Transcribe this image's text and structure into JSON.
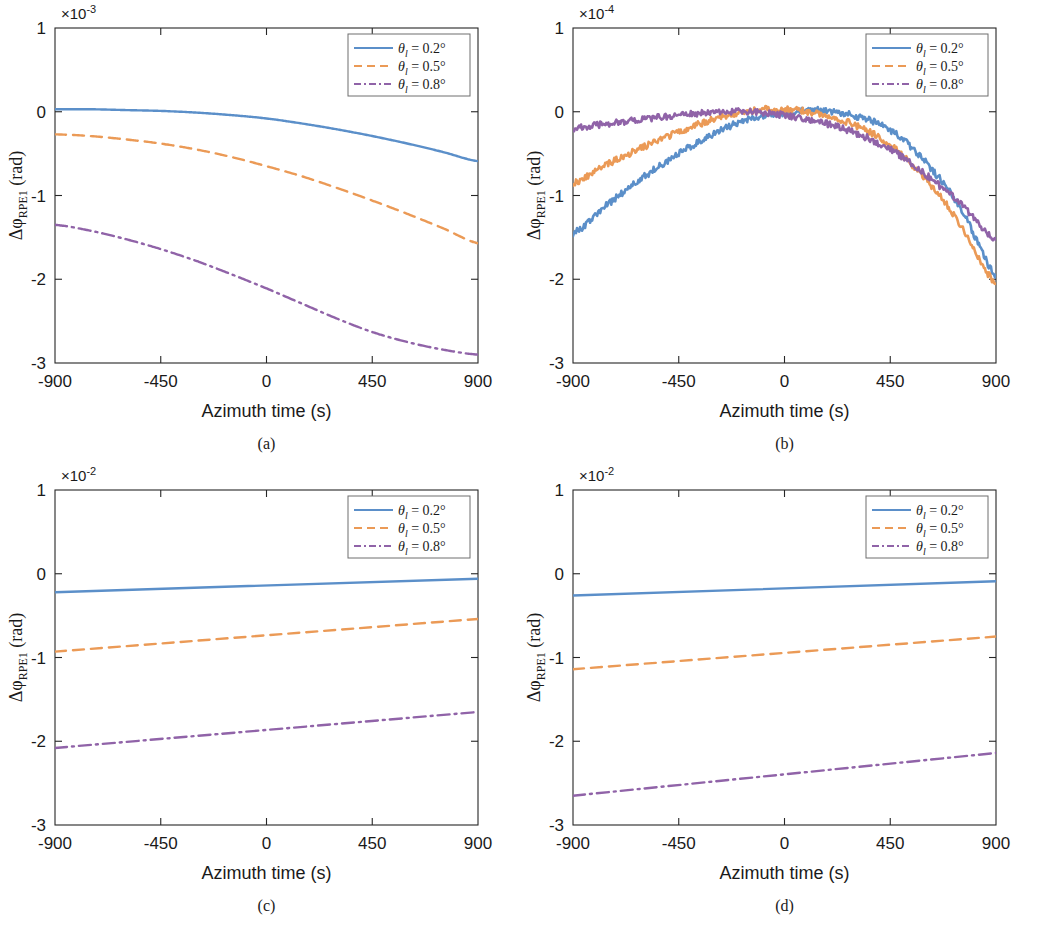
{
  "figure": {
    "panels": [
      {
        "id": "a",
        "caption": "(a)",
        "exponent_label": "×10",
        "exponent_power": "-3",
        "xlabel": "Azimuth time (s)",
        "ylabel_main": "Δφ",
        "ylabel_sub": "RPE1",
        "ylabel_unit": " (rad)",
        "xticks": [
          "-900",
          "-450",
          "0",
          "450",
          "900"
        ],
        "yticks": [
          "1",
          "0",
          "-1",
          "-2",
          "-3"
        ],
        "xlim": [
          -900,
          900
        ],
        "ylim": [
          -3,
          1
        ],
        "legend": [
          {
            "label": "θ",
            "sub": "l",
            "value": " = 0.2°",
            "style": "solid",
            "color": "#5B8FC9"
          },
          {
            "label": "θ",
            "sub": "l",
            "value": " = 0.5°",
            "style": "dashed",
            "color": "#EB9A56"
          },
          {
            "label": "θ",
            "sub": "l",
            "value": " = 0.8°",
            "style": "dashdot",
            "color": "#9063A8"
          }
        ]
      },
      {
        "id": "b",
        "caption": "(b)",
        "exponent_label": "×10",
        "exponent_power": "-4",
        "xlabel": "Azimuth time (s)",
        "ylabel_main": "Δφ",
        "ylabel_sub": "RPE1",
        "ylabel_unit": " (rad)",
        "xticks": [
          "-900",
          "-450",
          "0",
          "450",
          "900"
        ],
        "yticks": [
          "1",
          "0",
          "-1",
          "-2",
          "-3"
        ],
        "xlim": [
          -900,
          900
        ],
        "ylim": [
          -3,
          1
        ],
        "legend": [
          {
            "label": "θ",
            "sub": "l",
            "value": " = 0.2°",
            "style": "solid",
            "color": "#5B8FC9"
          },
          {
            "label": "θ",
            "sub": "l",
            "value": " = 0.5°",
            "style": "dashed",
            "color": "#EB9A56"
          },
          {
            "label": "θ",
            "sub": "l",
            "value": " = 0.8°",
            "style": "dashdot",
            "color": "#9063A8"
          }
        ]
      },
      {
        "id": "c",
        "caption": "(c)",
        "exponent_label": "×10",
        "exponent_power": "-2",
        "xlabel": "Azimuth time (s)",
        "ylabel_main": "Δφ",
        "ylabel_sub": "RPE1",
        "ylabel_unit": " (rad)",
        "xticks": [
          "-900",
          "-450",
          "0",
          "450",
          "900"
        ],
        "yticks": [
          "1",
          "0",
          "-1",
          "-2",
          "-3"
        ],
        "xlim": [
          -900,
          900
        ],
        "ylim": [
          -3,
          1
        ],
        "legend": [
          {
            "label": "θ",
            "sub": "l",
            "value": " = 0.2°",
            "style": "solid",
            "color": "#5B8FC9"
          },
          {
            "label": "θ",
            "sub": "l",
            "value": " = 0.5°",
            "style": "dashed",
            "color": "#EB9A56"
          },
          {
            "label": "θ",
            "sub": "l",
            "value": " = 0.8°",
            "style": "dashdot",
            "color": "#9063A8"
          }
        ]
      },
      {
        "id": "d",
        "caption": "(d)",
        "exponent_label": "×10",
        "exponent_power": "-2",
        "xlabel": "Azimuth time (s)",
        "ylabel_main": "Δφ",
        "ylabel_sub": "RPE1",
        "ylabel_unit": " (rad)",
        "xticks": [
          "-900",
          "-450",
          "0",
          "450",
          "900"
        ],
        "yticks": [
          "1",
          "0",
          "-1",
          "-2",
          "-3"
        ],
        "xlim": [
          -900,
          900
        ],
        "ylim": [
          -3,
          1
        ],
        "legend": [
          {
            "label": "θ",
            "sub": "l",
            "value": " = 0.2°",
            "style": "solid",
            "color": "#5B8FC9"
          },
          {
            "label": "θ",
            "sub": "l",
            "value": " = 0.5°",
            "style": "dashed",
            "color": "#EB9A56"
          },
          {
            "label": "θ",
            "sub": "l",
            "value": " = 0.8°",
            "style": "dashdot",
            "color": "#9063A8"
          }
        ]
      }
    ]
  },
  "chart_data": [
    {
      "panel": "a",
      "type": "line",
      "title": "",
      "xlabel": "Azimuth time (s)",
      "ylabel": "Δφ_RPE1 (rad)",
      "y_scale_exponent": -3,
      "xlim": [
        -900,
        900
      ],
      "ylim": [
        -3,
        1
      ],
      "grid": false,
      "legend_position": "top-right",
      "x": [
        -900,
        -750,
        -600,
        -450,
        -300,
        -150,
        0,
        150,
        300,
        450,
        600,
        750,
        900
      ],
      "series": [
        {
          "name": "θ_l = 0.2°",
          "style": "solid",
          "color": "#5B8FC9",
          "values": [
            0.03,
            0.03,
            0.02,
            0.01,
            -0.01,
            -0.04,
            -0.08,
            -0.14,
            -0.21,
            -0.29,
            -0.38,
            -0.48,
            -0.59
          ]
        },
        {
          "name": "θ_l = 0.5°",
          "style": "dashed",
          "color": "#EB9A56",
          "values": [
            -0.27,
            -0.29,
            -0.33,
            -0.38,
            -0.45,
            -0.54,
            -0.65,
            -0.77,
            -0.91,
            -1.06,
            -1.22,
            -1.39,
            -1.57
          ]
        },
        {
          "name": "θ_l = 0.8°",
          "style": "dashdot",
          "color": "#9063A8",
          "values": [
            -1.35,
            -1.42,
            -1.52,
            -1.64,
            -1.78,
            -1.94,
            -2.11,
            -2.29,
            -2.47,
            -2.63,
            -2.75,
            -2.84,
            -2.9
          ]
        }
      ]
    },
    {
      "panel": "b",
      "type": "line",
      "title": "",
      "xlabel": "Azimuth time (s)",
      "ylabel": "Δφ_RPE1 (rad)",
      "y_scale_exponent": -4,
      "xlim": [
        -900,
        900
      ],
      "ylim": [
        -3,
        1
      ],
      "grid": false,
      "noisy": true,
      "noise_amplitude": 0.04,
      "legend_position": "top-right",
      "x": [
        -900,
        -750,
        -600,
        -450,
        -300,
        -150,
        0,
        150,
        300,
        450,
        600,
        750,
        900
      ],
      "series": [
        {
          "name": "θ_l = 0.2°",
          "style": "solid",
          "color": "#5B8FC9",
          "values": [
            -1.45,
            -1.1,
            -0.78,
            -0.5,
            -0.26,
            -0.09,
            -0.02,
            0.02,
            -0.05,
            -0.22,
            -0.6,
            -1.15,
            -1.95
          ]
        },
        {
          "name": "θ_l = 0.5°",
          "style": "dashed",
          "color": "#EB9A56",
          "values": [
            -0.85,
            -0.62,
            -0.42,
            -0.24,
            -0.09,
            0.01,
            0.03,
            -0.03,
            -0.16,
            -0.4,
            -0.8,
            -1.35,
            -2.05
          ]
        },
        {
          "name": "θ_l = 0.8°",
          "style": "dashdot",
          "color": "#9063A8",
          "values": [
            -0.2,
            -0.14,
            -0.09,
            -0.04,
            -0.01,
            0.0,
            -0.04,
            -0.12,
            -0.25,
            -0.45,
            -0.75,
            -1.1,
            -1.52
          ]
        }
      ]
    },
    {
      "panel": "c",
      "type": "line",
      "title": "",
      "xlabel": "Azimuth time (s)",
      "ylabel": "Δφ_RPE1 (rad)",
      "y_scale_exponent": -2,
      "xlim": [
        -900,
        900
      ],
      "ylim": [
        -3,
        1
      ],
      "grid": false,
      "legend_position": "top-right",
      "x": [
        -900,
        900
      ],
      "series": [
        {
          "name": "θ_l = 0.2°",
          "style": "solid",
          "color": "#5B8FC9",
          "values": [
            -0.22,
            -0.06
          ]
        },
        {
          "name": "θ_l = 0.5°",
          "style": "dashed",
          "color": "#EB9A56",
          "values": [
            -0.93,
            -0.54
          ]
        },
        {
          "name": "θ_l = 0.8°",
          "style": "dashdot",
          "color": "#9063A8",
          "values": [
            -2.08,
            -1.65
          ]
        }
      ]
    },
    {
      "panel": "d",
      "type": "line",
      "title": "",
      "xlabel": "Azimuth time (s)",
      "ylabel": "Δφ_RPE1 (rad)",
      "y_scale_exponent": -2,
      "xlim": [
        -900,
        900
      ],
      "ylim": [
        -3,
        1
      ],
      "grid": false,
      "legend_position": "top-right",
      "x": [
        -900,
        900
      ],
      "series": [
        {
          "name": "θ_l = 0.2°",
          "style": "solid",
          "color": "#5B8FC9",
          "values": [
            -0.26,
            -0.09
          ]
        },
        {
          "name": "θ_l = 0.5°",
          "style": "dashed",
          "color": "#EB9A56",
          "values": [
            -1.14,
            -0.75
          ]
        },
        {
          "name": "θ_l = 0.8°",
          "style": "dashdot",
          "color": "#9063A8",
          "values": [
            -2.65,
            -2.14
          ]
        }
      ]
    }
  ]
}
